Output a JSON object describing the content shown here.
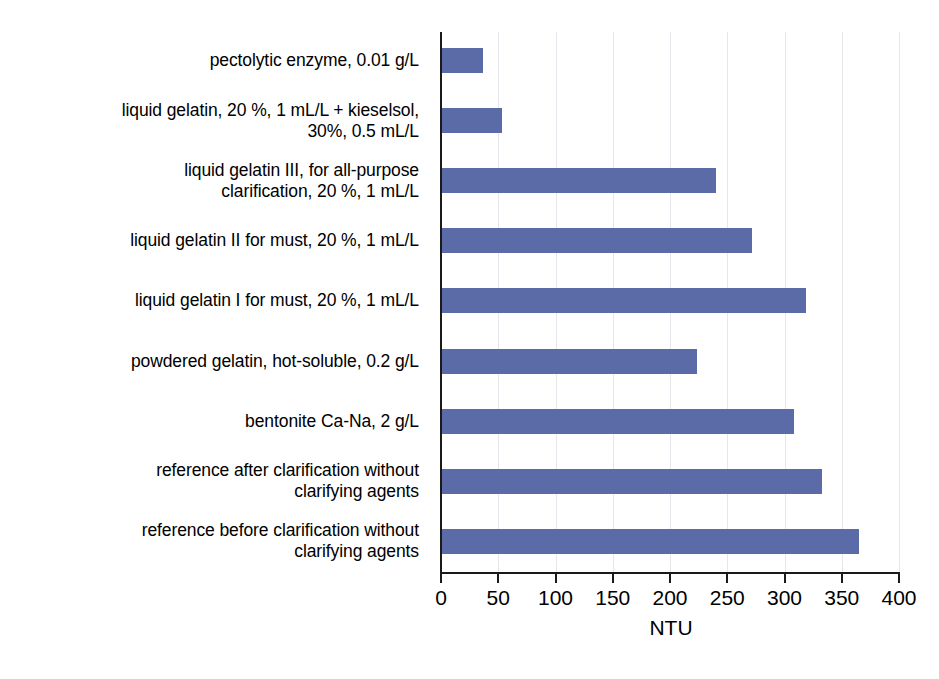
{
  "chart_data": {
    "type": "bar",
    "orientation": "horizontal",
    "title": "",
    "subtitle": "",
    "xlabel": "NTU",
    "ylabel": "",
    "xlim": [
      0,
      400
    ],
    "xticks": [
      0,
      50,
      100,
      150,
      200,
      250,
      300,
      350,
      400
    ],
    "xtick_labels": [
      "0",
      "50",
      "100",
      "150",
      "200",
      "250",
      "300",
      "350",
      "400"
    ],
    "grid": "vertical-only",
    "legend": "none",
    "series_color": "#5a6ba8",
    "categories": [
      "pectolytic enzyme, 0.01 g/L",
      "liquid gelatin, 20 %, 1 mL/L + kieselsol, 30%, 0.5 mL/L",
      "liquid gelatin III, for all-purpose clarification, 20 %, 1 mL/L",
      "liquid gelatin II for must, 20 %, 1 mL/L",
      "liquid gelatin I for must, 20 %, 1 mL/L",
      "powdered gelatin, hot-soluble, 0.2 g/L",
      "bentonite Ca-Na, 2 g/L",
      "reference after clarification without clarifying agents",
      "reference before clarification without clarifying agents"
    ],
    "category_lines": [
      [
        "pectolytic enzyme, 0.01 g/L"
      ],
      [
        "liquid gelatin, 20 %, 1 mL/L + kieselsol,",
        "30%, 0.5 mL/L"
      ],
      [
        "liquid gelatin III, for all-purpose",
        "clarification, 20 %, 1 mL/L"
      ],
      [
        "liquid gelatin II for must, 20 %, 1 mL/L"
      ],
      [
        "liquid gelatin I for must, 20 %, 1 mL/L"
      ],
      [
        "powdered gelatin, hot-soluble, 0.2 g/L"
      ],
      [
        "bentonite Ca-Na, 2 g/L"
      ],
      [
        "reference after clarification without",
        "clarifying agents"
      ],
      [
        "reference before clarification without",
        "clarifying agents"
      ]
    ],
    "values": [
      37,
      53,
      240,
      272,
      319,
      224,
      308,
      333,
      365
    ]
  }
}
